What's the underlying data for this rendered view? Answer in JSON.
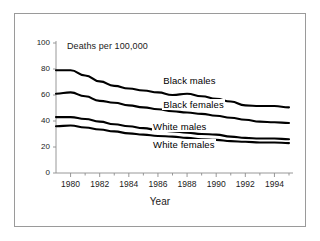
{
  "chart_data": {
    "type": "line",
    "title": "",
    "xlabel": "Year",
    "ylabel": "Deaths per 100,000",
    "xlim": [
      1979,
      1995
    ],
    "ylim": [
      0,
      100
    ],
    "grid": false,
    "legend_position": "inline-annotations",
    "xticks": [
      1980,
      1982,
      1984,
      1986,
      1988,
      1990,
      1992,
      1994
    ],
    "xtick_labels": [
      "1980",
      "1982",
      "1984",
      "1986",
      "1988",
      "1990",
      "1992",
      "1994"
    ],
    "yticks": [
      0,
      20,
      40,
      60,
      80,
      100
    ],
    "ytick_labels": [
      "0",
      "20",
      "40",
      "60",
      "80",
      "100"
    ],
    "x": [
      1979,
      1980,
      1981,
      1982,
      1983,
      1984,
      1985,
      1986,
      1987,
      1988,
      1989,
      1990,
      1991,
      1992,
      1993,
      1994,
      1995
    ],
    "series": [
      {
        "name": "Black males",
        "color": "#000000",
        "values": [
          79.0,
          79.0,
          75.0,
          70.5,
          67.0,
          65.0,
          63.5,
          62.0,
          60.0,
          61.0,
          59.0,
          57.0,
          55.0,
          52.0,
          51.5,
          51.5,
          50.5
        ],
        "label_x": 1986.3,
        "label_y": 70.5
      },
      {
        "name": "Black females",
        "color": "#000000",
        "values": [
          61.0,
          62.0,
          59.0,
          55.5,
          54.0,
          52.0,
          50.5,
          49.0,
          47.5,
          46.5,
          45.5,
          44.0,
          42.5,
          41.0,
          39.5,
          39.0,
          38.5
        ],
        "label_x": 1986.3,
        "label_y": 52.0
      },
      {
        "name": "White males",
        "color": "#000000",
        "values": [
          43.0,
          43.0,
          41.5,
          39.5,
          37.5,
          36.0,
          34.5,
          33.0,
          32.0,
          31.0,
          30.0,
          29.5,
          28.0,
          27.0,
          26.5,
          26.5,
          26.0
        ],
        "label_x": 1985.6,
        "label_y": 35.5
      },
      {
        "name": "White females",
        "color": "#000000",
        "values": [
          36.0,
          36.5,
          35.0,
          33.5,
          32.0,
          30.5,
          29.5,
          28.5,
          28.0,
          27.0,
          26.0,
          25.5,
          24.5,
          24.0,
          23.5,
          23.5,
          23.0
        ],
        "label_x": 1985.6,
        "label_y": 21.5
      }
    ]
  },
  "colors": {
    "frame_border": "#9a9a9a",
    "axis": "#8c8c8c",
    "line": "#000000",
    "text": "#1a1a1a",
    "background": "#ffffff"
  }
}
